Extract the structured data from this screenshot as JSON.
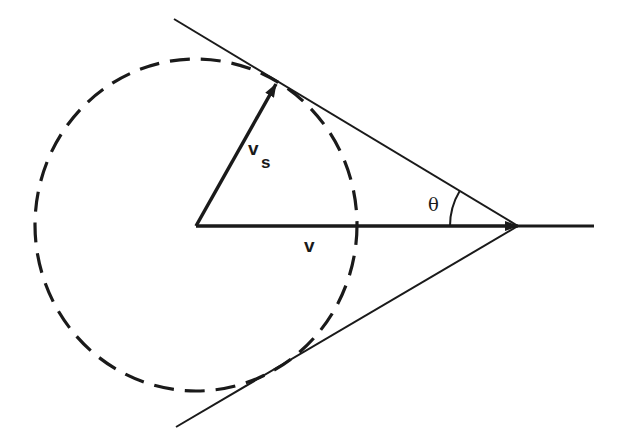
{
  "figure": {
    "type": "geometric-diagram",
    "colors": {
      "ink": "#1a1a1a",
      "background": "#ffffff"
    }
  },
  "elements": {
    "circle": {
      "style": "dashed",
      "center": [
        196,
        225
      ],
      "rx": 161,
      "ry": 166
    },
    "vector_vs": {
      "label": "v",
      "subscript": "s",
      "from": [
        196,
        226
      ],
      "to": [
        276,
        84
      ]
    },
    "vector_v": {
      "label": "v",
      "from": [
        196,
        226
      ],
      "to": [
        518,
        226
      ]
    },
    "axis_extension": {
      "from": [
        518,
        226
      ],
      "to": [
        594,
        226
      ]
    },
    "tangent_upper": {
      "from": [
        174,
        19
      ],
      "to": [
        518,
        226
      ]
    },
    "tangent_lower": {
      "from": [
        176,
        427
      ],
      "to": [
        518,
        226
      ]
    },
    "angle": {
      "label": "θ",
      "vertex": [
        518,
        226
      ],
      "radius": 68
    }
  }
}
